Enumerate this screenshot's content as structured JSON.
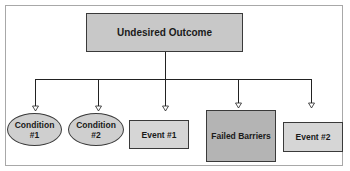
{
  "diagram": {
    "root": {
      "label": "Undesired Outcome",
      "fill": "#c8c8c8"
    },
    "children": [
      {
        "label": "Condition\n#1",
        "line1": "Condition",
        "line2": "#1",
        "shape": "ellipse",
        "fill": "#cfcfcf"
      },
      {
        "label": "Condition\n#2",
        "line1": "Condition",
        "line2": "#2",
        "shape": "ellipse",
        "fill": "#cfcfcf"
      },
      {
        "label": "Event #1",
        "shape": "rectangle",
        "fill": "#d6d6d6"
      },
      {
        "label": "Failed Barriers",
        "shape": "rectangle",
        "fill": "#b4b4b4"
      },
      {
        "label": "Event #2",
        "shape": "rectangle",
        "fill": "#d6d6d6"
      }
    ],
    "colors": {
      "line": "#222222",
      "frame": "#a8a8a8"
    }
  }
}
